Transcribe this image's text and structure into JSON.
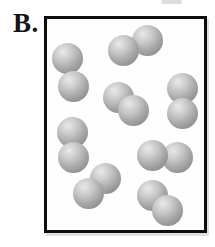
{
  "figure": {
    "label": "B.",
    "box": {
      "x": 44,
      "y": 16,
      "width": 163,
      "height": 217,
      "border_width": 3
    },
    "sphere_radius": 15.5,
    "colors": {
      "border": "#0d0d0d",
      "background": "#ffffff",
      "sphere_highlight": "#e9e9e9",
      "sphere_light": "#c9c9c9",
      "sphere_mid": "#aaaaaa",
      "sphere_shade": "#8e8e8e",
      "sphere_dark": "#747474"
    },
    "molecule_count": 8,
    "atoms_per_molecule": 2,
    "molecules": [
      {
        "name": "top-middle",
        "spheres": [
          {
            "x": 147,
            "y": 40
          },
          {
            "x": 123,
            "y": 50
          }
        ]
      },
      {
        "name": "upper-left",
        "spheres": [
          {
            "x": 67,
            "y": 58
          },
          {
            "x": 73,
            "y": 86
          }
        ]
      },
      {
        "name": "upper-right",
        "spheres": [
          {
            "x": 182,
            "y": 88
          },
          {
            "x": 182,
            "y": 113
          }
        ]
      },
      {
        "name": "center",
        "spheres": [
          {
            "x": 118,
            "y": 97
          },
          {
            "x": 133,
            "y": 110
          }
        ]
      },
      {
        "name": "middle-left",
        "spheres": [
          {
            "x": 72,
            "y": 132
          },
          {
            "x": 73,
            "y": 157
          }
        ]
      },
      {
        "name": "middle-right",
        "spheres": [
          {
            "x": 177,
            "y": 157
          },
          {
            "x": 152,
            "y": 155
          }
        ]
      },
      {
        "name": "bottom-center",
        "spheres": [
          {
            "x": 105,
            "y": 178
          },
          {
            "x": 88,
            "y": 193
          }
        ]
      },
      {
        "name": "bottom-right",
        "spheres": [
          {
            "x": 152,
            "y": 195
          },
          {
            "x": 167,
            "y": 210
          }
        ]
      }
    ]
  }
}
